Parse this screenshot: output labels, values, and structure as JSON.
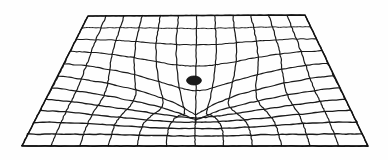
{
  "figure": {
    "background_color": "#fefefe",
    "line_color": "#1a1a1a",
    "boundary_color": "#111111",
    "singularity_color": "#1a1a1a"
  },
  "chart_data": {
    "type": "line",
    "xlabel": "",
    "ylabel": "",
    "grid": true,
    "legend": null,
    "annotations": [
      {
        "name": "singularity",
        "label": "point mass",
        "x": 194,
        "y": 80.5,
        "rx": 7.5,
        "ry": 4.6
      }
    ],
    "surface": {
      "kind": "warped-perspective-quad-mesh",
      "u_divisions": 12,
      "v_divisions": 11,
      "corners": {
        "top_left": [
          88,
          16
        ],
        "top_right": [
          305,
          15
        ],
        "bottom_right": [
          368,
          146
        ],
        "bottom_left": [
          22,
          146
        ]
      },
      "well": {
        "center_u": 0.5,
        "center_v": 0.5,
        "depth": 56,
        "radius": 0.47,
        "pull": 0.86,
        "falloff": 2.35
      },
      "jitter_amplitude": 0.55,
      "stroke_width_near": 1.45,
      "stroke_width_far": 0.95
    },
    "axis_ranges": {
      "x": [
        0,
        388
      ],
      "y": [
        0,
        160
      ]
    }
  }
}
